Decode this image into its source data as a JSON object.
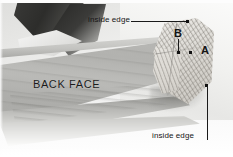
{
  "figure": {
    "type": "annotated-photograph",
    "palette": {
      "annotation_ink": "#151515",
      "board_face": "#b5b5b2",
      "end_grain": "#ded:b",
      "background": "#f2f2f1"
    }
  },
  "annotations": {
    "inside_edge_top": {
      "label": "inside edge",
      "x": 88,
      "y": 16,
      "leader": {
        "from_x": 131,
        "from_y": 21,
        "to_x": 188,
        "to_y": 21,
        "orientation": "horizontal"
      },
      "marker": {
        "x": 188,
        "y": 20,
        "shape": "square-dot"
      }
    },
    "inside_edge_bottom": {
      "label": "inside edge",
      "x": 152,
      "y": 132,
      "leader": {
        "from_x": 207,
        "from_y": 86,
        "to_x": 207,
        "to_y": 140,
        "orientation": "vertical"
      },
      "marker": {
        "x": 206,
        "y": 85,
        "shape": "square-dot"
      }
    },
    "point_b": {
      "label": "B",
      "x": 174,
      "y": 28,
      "leader": {
        "from_x": 178,
        "from_y": 38,
        "to_x": 178,
        "to_y": 52,
        "orientation": "vertical"
      },
      "marker": {
        "x": 177,
        "y": 52,
        "shape": "square-dot"
      }
    },
    "point_a": {
      "label": "A",
      "x": 201,
      "y": 45,
      "marker": {
        "x": 190,
        "y": 51,
        "shape": "square-dot"
      }
    },
    "back_face": {
      "label": "BACK FACE",
      "x": 33,
      "y": 79
    }
  }
}
